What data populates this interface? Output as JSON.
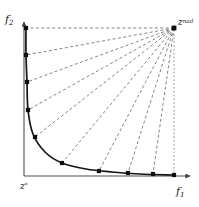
{
  "figure": {
    "width": 199,
    "height": 207
  },
  "labels": {
    "y_axis": {
      "base": "f",
      "sub": "2"
    },
    "x_axis": {
      "base": "f",
      "sub": "1"
    },
    "nadir_point": {
      "base": "z",
      "sup": "nad"
    },
    "ideal_point": {
      "base": "z",
      "sup": "*"
    }
  },
  "colors": {
    "curve": "#141414",
    "axis": "#4d4d4d",
    "ray": "#6e6e6e",
    "marker": "#0d0d0d",
    "dotted_line": "#8c8c8c",
    "background": "#ffffff"
  },
  "chart_data": {
    "type": "line",
    "xlabel": "f1",
    "ylabel": "f2",
    "grid": false,
    "legend": "none",
    "axes": {
      "origin_px": {
        "x": 24,
        "y": 176
      },
      "x_axis_end_px": {
        "x": 190,
        "y": 176
      },
      "y_axis_end_px": {
        "x": 24,
        "y": 22
      }
    },
    "nadir_point_px": {
      "x": 174,
      "y": 28
    },
    "ideal_point_px": {
      "x": 24,
      "y": 176
    },
    "front_curve_px": [
      {
        "x": 26,
        "y": 28
      },
      {
        "x": 26,
        "y": 55
      },
      {
        "x": 27,
        "y": 82
      },
      {
        "x": 28,
        "y": 110
      },
      {
        "x": 33,
        "y": 134
      },
      {
        "x": 45,
        "y": 152
      },
      {
        "x": 62,
        "y": 163
      },
      {
        "x": 86,
        "y": 169
      },
      {
        "x": 112,
        "y": 172
      },
      {
        "x": 140,
        "y": 174
      },
      {
        "x": 174,
        "y": 175
      }
    ],
    "markers_px": [
      {
        "x": 26,
        "y": 28
      },
      {
        "x": 26,
        "y": 55
      },
      {
        "x": 27,
        "y": 82
      },
      {
        "x": 28,
        "y": 110
      },
      {
        "x": 35,
        "y": 137
      },
      {
        "x": 62,
        "y": 163
      },
      {
        "x": 99,
        "y": 171
      },
      {
        "x": 128,
        "y": 173
      },
      {
        "x": 153,
        "y": 174
      },
      {
        "x": 174,
        "y": 175
      }
    ],
    "rays_from_nadir_px": [
      {
        "x2": 26,
        "y2": 28
      },
      {
        "x2": 26,
        "y2": 55
      },
      {
        "x2": 27,
        "y2": 82
      },
      {
        "x2": 28,
        "y2": 110
      },
      {
        "x2": 35,
        "y2": 137
      },
      {
        "x2": 62,
        "y2": 163
      },
      {
        "x2": 99,
        "y2": 171
      },
      {
        "x2": 128,
        "y2": 173
      },
      {
        "x2": 153,
        "y2": 174
      }
    ],
    "dotted_vertical_px": {
      "x": 174,
      "y1": 30,
      "y2": 176
    },
    "marker_count": 10,
    "ray_count": 9
  }
}
